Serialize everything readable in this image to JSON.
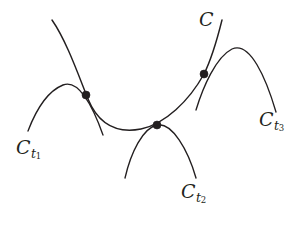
{
  "figure": {
    "kind": "mathematical-diagram",
    "background_color": "#ffffff",
    "ink_color": "#231f20",
    "width": 302,
    "height": 227
  },
  "labels": {
    "main_curve": {
      "base": "C",
      "sub": "",
      "subsub": ""
    },
    "arc_1": {
      "base": "C",
      "sub": "t",
      "subsub": "1"
    },
    "arc_2": {
      "base": "C",
      "sub": "t",
      "subsub": "2"
    },
    "arc_3": {
      "base": "C",
      "sub": "t",
      "subsub": "3"
    }
  },
  "curves": {
    "main_curve": {
      "name": "C",
      "path": "M 52 20 C 66 40 78 74 88 99 C 100 128 120 133 141 129 C 165 124 189 101 204 74 C 212 58 218 36 222 20"
    },
    "arc_1": {
      "name": "C_t1",
      "path": "M 28 131 C 36 110 48 91 63 85 C 78 79 92 104 103 135"
    },
    "arc_2": {
      "name": "C_t2",
      "path": "M 125 178 C 131 152 143 128 157 125 C 172 122 188 150 196 178"
    },
    "arc_3": {
      "name": "C_t3",
      "path": "M 196 110 C 203 87 216 57 232 49 C 250 41 266 78 276 112"
    }
  },
  "intersection_points": [
    {
      "name": "intersection-1",
      "x": 86,
      "y": 95
    },
    {
      "name": "intersection-2",
      "x": 157,
      "y": 125
    },
    {
      "name": "intersection-3",
      "x": 204,
      "y": 74
    }
  ]
}
